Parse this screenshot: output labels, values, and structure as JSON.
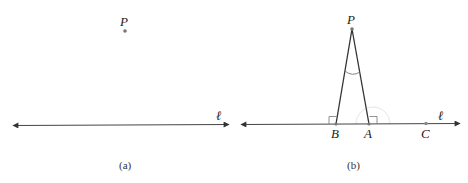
{
  "figure_a": {
    "caption": "(a)",
    "point_label": "P",
    "line_label": "ℓ"
  },
  "figure_b": {
    "caption": "(b)",
    "apex_label": "P",
    "foot_label": "B",
    "second_label": "A",
    "third_label": "C",
    "line_label": "ℓ"
  },
  "colors": {
    "stroke": "#333333",
    "point": "#777777",
    "faint_arc": "#d8d8d8"
  }
}
